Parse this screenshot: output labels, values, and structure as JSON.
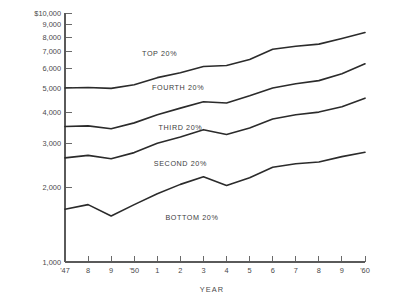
{
  "chart_data": {
    "type": "line",
    "title": "",
    "xlabel": "YEAR",
    "ylabel": "",
    "yscale": "log",
    "ylim": [
      1000,
      10000
    ],
    "grid": false,
    "legend_position": "inline-labels",
    "x": [
      1947,
      1948,
      1949,
      1950,
      1951,
      1952,
      1953,
      1954,
      1955,
      1956,
      1957,
      1958,
      1959,
      1960
    ],
    "xtick_labels": [
      "'47",
      "8",
      "9",
      "'50",
      "1",
      "2",
      "3",
      "4",
      "5",
      "6",
      "7",
      "8",
      "9",
      "'60"
    ],
    "ytick_labels": [
      "$10,000",
      "9,000",
      "8,000",
      "7,000",
      "6,000",
      "5,000",
      "4,000",
      "3,000",
      "2,000",
      "1,000"
    ],
    "ytick_values": [
      10000,
      9000,
      8000,
      7000,
      6000,
      5000,
      4000,
      3000,
      2000,
      1000
    ],
    "series": [
      {
        "name": "TOP 20%",
        "label": "TOP 20%",
        "label_x": 1951.1,
        "label_y": 6750,
        "values": [
          5000,
          5020,
          4980,
          5150,
          5500,
          5750,
          6100,
          6150,
          6500,
          7150,
          7350,
          7500,
          7900,
          8350
        ]
      },
      {
        "name": "FOURTH 20%",
        "label": "FOURTH 20%",
        "label_x": 1951.9,
        "label_y": 4900,
        "values": [
          3500,
          3520,
          3430,
          3620,
          3900,
          4150,
          4400,
          4350,
          4650,
          5000,
          5200,
          5350,
          5700,
          6250
        ]
      },
      {
        "name": "THIRD 20%",
        "label": "THIRD 20%",
        "label_x": 1952.0,
        "label_y": 3380,
        "values": [
          2620,
          2680,
          2600,
          2750,
          3000,
          3180,
          3400,
          3250,
          3450,
          3750,
          3900,
          4000,
          4200,
          4550
        ]
      },
      {
        "name": "SECOND 20%",
        "label": "SECOND 20%",
        "label_x": 1952.0,
        "label_y": 2420,
        "values": [
          1630,
          1700,
          1530,
          1700,
          1880,
          2050,
          2200,
          2030,
          2180,
          2400,
          2480,
          2520,
          2650,
          2760
        ]
      },
      {
        "name": "BOTTOM 20%",
        "label": "BOTTOM 20%",
        "label_x": 1952.5,
        "label_y": 1480,
        "values": [
          null,
          null,
          null,
          null,
          null,
          null,
          null,
          null,
          null,
          null,
          null,
          null,
          null,
          null
        ]
      }
    ],
    "note": "Five income-quintile lines plotted on a logarithmic dollar scale from 1947 to 1960."
  },
  "colors": {
    "line": "#2b2b2b",
    "axis": "#5a5a5a",
    "text": "#4a4a4a",
    "background": "#ffffff"
  }
}
